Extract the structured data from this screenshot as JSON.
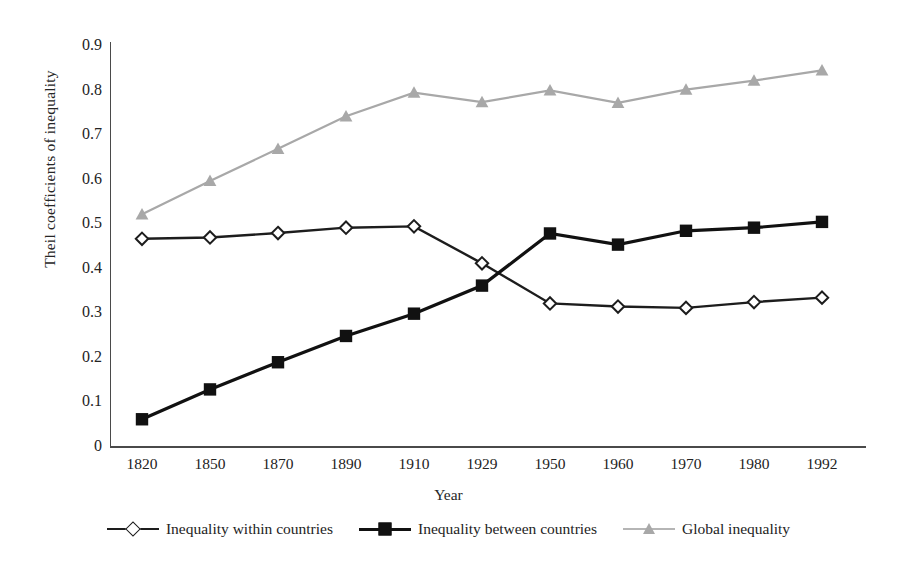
{
  "chart_data": {
    "type": "line",
    "title": "",
    "xlabel": "Year",
    "ylabel": "Theil coefficients of inequality",
    "categories": [
      "1820",
      "1850",
      "1870",
      "1890",
      "1910",
      "1929",
      "1950",
      "1960",
      "1970",
      "1980",
      "1992"
    ],
    "ylim": [
      0,
      0.9
    ],
    "yticks": [
      "0.9",
      "0.8",
      "0.7",
      "0.6",
      "0.5",
      "0.4",
      "0.3",
      "0.2",
      "0.1",
      "0"
    ],
    "ytick_values": [
      0.9,
      0.8,
      0.7,
      0.6,
      0.5,
      0.4,
      0.3,
      0.2,
      0.1,
      0
    ],
    "grid": false,
    "legend_position": "bottom",
    "series": [
      {
        "name": "Inequality within countries",
        "marker": "diamond-open",
        "color": "#1d1d1d",
        "values": [
          0.465,
          0.468,
          0.478,
          0.49,
          0.493,
          0.41,
          0.32,
          0.313,
          0.31,
          0.323,
          0.333
        ]
      },
      {
        "name": "Inequality between countries",
        "marker": "square-filled",
        "color": "#111111",
        "values": [
          0.06,
          0.127,
          0.188,
          0.247,
          0.297,
          0.36,
          0.477,
          0.452,
          0.483,
          0.49,
          0.503
        ]
      },
      {
        "name": "Global inequality",
        "marker": "triangle-filled",
        "color": "#a8a8a8",
        "values": [
          0.52,
          0.595,
          0.667,
          0.74,
          0.793,
          0.772,
          0.798,
          0.77,
          0.8,
          0.82,
          0.843
        ]
      }
    ]
  },
  "axes": {
    "y_title": "Theil coefficients of inequality",
    "x_title": "Year"
  },
  "legend": {
    "items": [
      {
        "label": "Inequality within countries"
      },
      {
        "label": "Inequality between countries"
      },
      {
        "label": "Global inequality"
      }
    ]
  },
  "colors": {
    "axis": "#4a4a4a",
    "series_within": "#1d1d1d",
    "series_between": "#111111",
    "series_global": "#a8a8a8",
    "background": "#ffffff",
    "text": "#232323"
  }
}
